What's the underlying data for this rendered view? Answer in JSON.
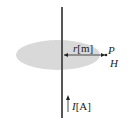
{
  "diagram": {
    "radius_label_var": "r",
    "radius_label_unit": "[m]",
    "point_label": "P",
    "field_label": "H",
    "current_label_var": "I",
    "current_label_unit": "[A]",
    "colors": {
      "disc_fill": "#d9d9d9",
      "wire": "#555555",
      "text": "#222222"
    }
  }
}
